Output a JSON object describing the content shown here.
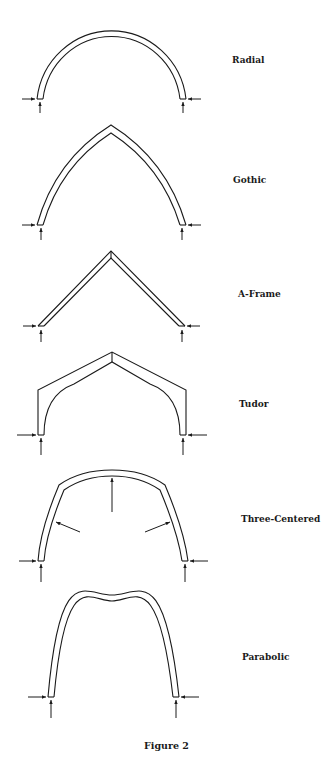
{
  "figure": {
    "caption": "Figure 2",
    "ink_color": "#1a1a1a",
    "background": "#ffffff"
  },
  "arches": [
    {
      "id": "radial",
      "label": "Radial",
      "label_pos": [
        232,
        55
      ]
    },
    {
      "id": "gothic",
      "label": "Gothic",
      "label_pos": [
        233,
        175
      ]
    },
    {
      "id": "aframe",
      "label": "A-Frame",
      "label_pos": [
        238,
        289
      ]
    },
    {
      "id": "tudor",
      "label": "Tudor",
      "label_pos": [
        239,
        399
      ]
    },
    {
      "id": "three-centered",
      "label": "Three-Centered",
      "label_pos": [
        241,
        514
      ]
    },
    {
      "id": "parabolic",
      "label": "Parabolic",
      "label_pos": [
        242,
        652
      ]
    }
  ],
  "forces": {
    "description": "Horizontal thrust arrows and vertical reaction arrows at each arch base; three-centered arch also shows interior radial load arrows"
  }
}
